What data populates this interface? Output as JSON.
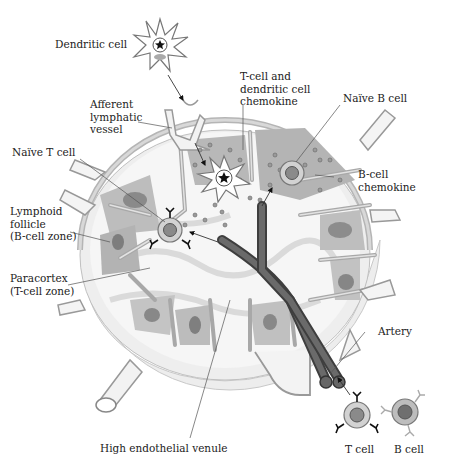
{
  "diagram": {
    "labels": {
      "dendritic_cell": "Dendritic cell",
      "afferent_lymphatic": "Afferent\nlymphatic\nvessel",
      "t_dc_chemokine": "T-cell and\ndendritic cell\nchemokine",
      "naive_b_cell": "Naïve B cell",
      "naive_t_cell": "Naïve T cell",
      "b_cell_chemokine": "B-cell\nchemokine",
      "lymphoid_follicle": "Lymphoid\nfollicle\n(B-cell zone)",
      "paracortex": "Paracortex\n(T-cell zone)",
      "artery": "Artery",
      "hev": "High endothelial venule",
      "t_cell": "T cell",
      "b_cell": "B cell"
    },
    "colors": {
      "capsule": "#b9b9b9",
      "medulla_bg": "#ededed",
      "follicle": "#a9a9a9",
      "germinal_center": "#7d7d7d",
      "vessel": "#5a5a5a",
      "cell_ring": "#cfcfcf",
      "cell_nucleus": "#8a8a8a",
      "line": "#555555"
    }
  }
}
